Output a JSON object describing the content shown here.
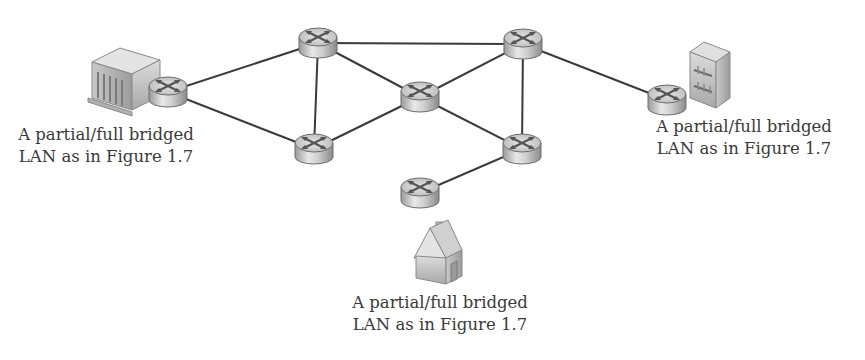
{
  "diagram": {
    "type": "network-topology",
    "link_color": "#3a3a3a",
    "routers": [
      {
        "id": "r-left",
        "x": 168,
        "y": 92
      },
      {
        "id": "r-top-left",
        "x": 318,
        "y": 43
      },
      {
        "id": "r-bottom-left",
        "x": 314,
        "y": 149
      },
      {
        "id": "r-center",
        "x": 420,
        "y": 97
      },
      {
        "id": "r-top-right",
        "x": 523,
        "y": 44
      },
      {
        "id": "r-bottom-right",
        "x": 522,
        "y": 149
      },
      {
        "id": "r-bottom",
        "x": 420,
        "y": 193
      },
      {
        "id": "r-right",
        "x": 667,
        "y": 100
      }
    ],
    "links": [
      [
        "r-left",
        "r-top-left"
      ],
      [
        "r-left",
        "r-bottom-left"
      ],
      [
        "r-top-left",
        "r-bottom-left"
      ],
      [
        "r-top-left",
        "r-top-right"
      ],
      [
        "r-top-left",
        "r-center"
      ],
      [
        "r-bottom-left",
        "r-center"
      ],
      [
        "r-center",
        "r-top-right"
      ],
      [
        "r-center",
        "r-bottom-right"
      ],
      [
        "r-top-right",
        "r-bottom-right"
      ],
      [
        "r-top-right",
        "r-right"
      ],
      [
        "r-bottom-right",
        "r-bottom"
      ]
    ],
    "lans": [
      {
        "id": "lan-left",
        "kind": "office-building",
        "line1": "A partial/full bridged",
        "line2": "LAN as in Figure 1.7"
      },
      {
        "id": "lan-right",
        "kind": "tower-building",
        "line1": "A partial/full bridged",
        "line2": "LAN as in Figure 1.7"
      },
      {
        "id": "lan-bottom",
        "kind": "house",
        "line1": "A partial/full bridged",
        "line2": "LAN as in Figure 1.7"
      }
    ]
  }
}
